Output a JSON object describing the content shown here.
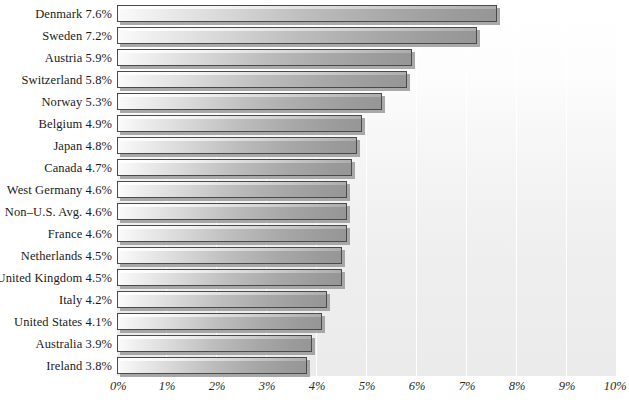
{
  "chart_data": {
    "type": "bar",
    "orientation": "horizontal",
    "title": "",
    "subtitle": "",
    "xlabel": "",
    "ylabel": "",
    "xlim": [
      0,
      10
    ],
    "grid": true,
    "legend": null,
    "unit": "%",
    "xticks": [
      "0%",
      "1%",
      "2%",
      "3%",
      "4%",
      "5%",
      "6%",
      "7%",
      "8%",
      "9%",
      "10%"
    ],
    "xtick_values": [
      0,
      1,
      2,
      3,
      4,
      5,
      6,
      7,
      8,
      9,
      10
    ],
    "categories": [
      "Denmark",
      "Sweden",
      "Austria",
      "Switzerland",
      "Norway",
      "Belgium",
      "Japan",
      "Canada",
      "West Germany",
      "Non–U.S. Avg.",
      "France",
      "Netherlands",
      "United Kingdom",
      "Italy",
      "United States",
      "Australia",
      "Ireland"
    ],
    "values": [
      7.6,
      7.2,
      5.9,
      5.8,
      5.3,
      4.9,
      4.8,
      4.7,
      4.6,
      4.6,
      4.6,
      4.5,
      4.5,
      4.2,
      4.1,
      3.9,
      3.8
    ],
    "value_labels": [
      "7.6%",
      "7.2%",
      "5.9%",
      "5.8%",
      "5.3%",
      "4.9%",
      "4.8%",
      "4.7%",
      "4.6%",
      "4.6%",
      "4.6%",
      "4.5%",
      "4.5%",
      "4.2%",
      "4.1%",
      "3.9%",
      "3.8%"
    ],
    "row_labels": [
      "Denmark 7.6%",
      "Sweden 7.2%",
      "Austria 5.9%",
      "Switzerland 5.8%",
      "Norway 5.3%",
      "Belgium 4.9%",
      "Japan 4.8%",
      "Canada 4.7%",
      "West Germany 4.6%",
      "Non–U.S. Avg. 4.6%",
      "France 4.6%",
      "Netherlands 4.5%",
      "United Kingdom 4.5%",
      "Italy 4.2%",
      "United States 4.1%",
      "Australia 3.9%",
      "Ireland 3.8%"
    ]
  },
  "colors": {
    "bar_light": "#fbfbfb",
    "bar_dark": "#969696",
    "bar_outline": "#4a4a4a",
    "bar_shadow": "#9a9a9a",
    "plot_background": "#eeeeee",
    "gridline": "#ffffff",
    "text": "#1a1a1a",
    "page_background": "#ffffff"
  }
}
